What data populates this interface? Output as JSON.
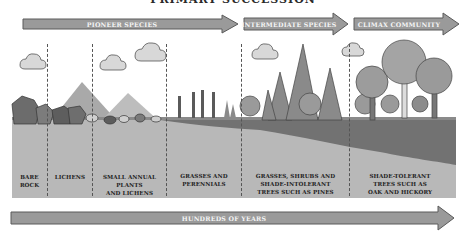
{
  "title": "PRIMARY SUCCESSION",
  "stage_arrows": [
    {
      "label": "PIONEER SPECIES"
    },
    {
      "label": "INTERMEDIATE SPECIES"
    },
    {
      "label": "CLIMAX COMMUNITY"
    }
  ],
  "stages": [
    {
      "label_lines": [
        "BARE",
        "ROCK"
      ]
    },
    {
      "label_lines": [
        "LICHENS"
      ]
    },
    {
      "label_lines": [
        "SMALL ANNUAL",
        "PLANTS",
        "AND LICHENS"
      ]
    },
    {
      "label_lines": [
        "GRASSES AND",
        "PERENNIALS"
      ]
    },
    {
      "label_lines": [
        "GRASSES, SHRUBS AND",
        "SHADE-INTOLERANT",
        "TREES SUCH AS PINES"
      ]
    },
    {
      "label_lines": [
        "SHADE-TOLERANT",
        "TREES SUCH AS",
        "OAK AND HICKORY"
      ]
    }
  ],
  "timeline": {
    "label": "HUNDREDS OF YEARS"
  },
  "colors": {
    "arrow_fill": "#9a9a9a",
    "arrow_stroke": "#5a5a5a",
    "sky": "#ffffff",
    "topsoil": "#707070",
    "subsoil": "#b4b4b4",
    "rock": "#6a6a6a",
    "mountain": "#a8a8a8",
    "tree_dark": "#6e6e6e",
    "tree_light": "#8e8e8e"
  }
}
